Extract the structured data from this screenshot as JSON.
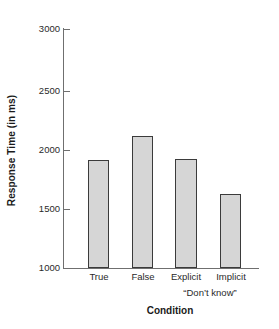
{
  "chart_data": {
    "type": "bar",
    "title": "",
    "categories": [
      "True",
      "False",
      "Explicit",
      "Implicit"
    ],
    "values": [
      1900,
      2100,
      1910,
      1620
    ],
    "series": [
      {
        "name": "Response Time",
        "values": [
          1900,
          2100,
          1910,
          1620
        ]
      }
    ],
    "xlabel": "Condition",
    "ylabel": "Response Time (in ms)",
    "ylim": [
      1000,
      3000
    ],
    "yticks": [
      1000,
      1500,
      2000,
      2500,
      3000
    ],
    "ytick_labels": [
      "1000",
      "1500",
      "2000",
      "2500",
      "3000"
    ],
    "grid": false,
    "legend": null,
    "annotations": [
      {
        "text": "“Don’t know”",
        "covers": [
          "Explicit",
          "Implicit"
        ]
      }
    ],
    "bar_fill_color": "#d6d6d6",
    "bar_edge_color": "#3b3b3b",
    "axis_color": "#6f6f6f"
  },
  "axes": {
    "y_title": "Response Time (in ms)",
    "x_title": "Condition",
    "y_tick_labels": [
      "3000",
      "2500",
      "2000",
      "1500",
      "1000"
    ],
    "x_tick_labels": [
      "True",
      "False",
      "Explicit",
      "Implicit"
    ],
    "group_label": "“Don’t know”"
  }
}
